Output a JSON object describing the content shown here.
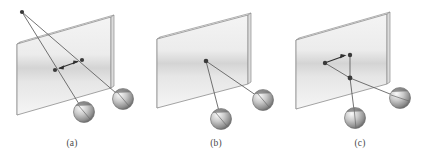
{
  "figure": {
    "background_color": "#ffffff",
    "width": 432,
    "height": 163
  },
  "style": {
    "line_color": "#555555",
    "line_color_dark": "#3b3b3b",
    "plane_stroke": "#8a8a8a",
    "plane_fill_light": "#f2f2f2",
    "plane_fill_mid": "#d8d8d8",
    "edge_fill": "#e8e8e8",
    "sphere_light": "#f0f0f0",
    "sphere_mid": "#b9b9b9",
    "sphere_dark": "#4f4f4f",
    "node_color": "#3a3a3a",
    "caption_color": "#4a4a4a"
  },
  "panels": [
    {
      "id": "a",
      "caption": "(a)",
      "description": "Two rays from a common apex above-left pierce the plane at two separate points joined by a double-headed arrow, then continue to two spheres below.",
      "apex": {
        "x": 22,
        "y": 12
      },
      "pierce_points": [
        {
          "x": 55,
          "y": 70
        },
        {
          "x": 82,
          "y": 60
        }
      ],
      "arrow": {
        "type": "double-headed",
        "from": {
          "x": 57,
          "y": 68
        },
        "to": {
          "x": 80,
          "y": 62
        }
      },
      "spheres": [
        {
          "cx": 84,
          "cy": 112,
          "r": 10.5
        },
        {
          "cx": 123,
          "cy": 99,
          "r": 10.5
        }
      ]
    },
    {
      "id": "b",
      "caption": "(b)",
      "description": "A single vertex on the plane sends two rays down to two spheres below.",
      "vertex": {
        "x": 62,
        "y": 61
      },
      "spheres": [
        {
          "cx": 77,
          "cy": 119,
          "r": 10.5
        },
        {
          "cx": 119,
          "cy": 100,
          "r": 10.5
        }
      ]
    },
    {
      "id": "c",
      "caption": "(c)",
      "description": "A horizontal arrow on the plane points right from a dot to an upper node; a lower vertex connects to both the upper node and two spheres below.",
      "upper_node": {
        "x": 62,
        "y": 55
      },
      "left_dot": {
        "x": 37,
        "y": 63
      },
      "arrow": {
        "type": "single-headed",
        "from": {
          "x": 38,
          "y": 62
        },
        "to": {
          "x": 58,
          "y": 55
        }
      },
      "lower_vertex": {
        "x": 62,
        "y": 78
      },
      "spheres": [
        {
          "cx": 67,
          "cy": 118,
          "r": 10.5
        },
        {
          "cx": 112,
          "cy": 98,
          "r": 10.5
        }
      ]
    }
  ],
  "captions": {
    "a": "(a)",
    "b": "(b)",
    "c": "(c)"
  }
}
